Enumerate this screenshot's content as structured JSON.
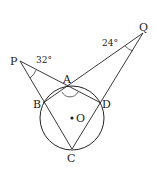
{
  "diagram": {
    "points": {
      "P": {
        "label": "P",
        "x": 20,
        "y": 61
      },
      "Q": {
        "label": "Q",
        "x": 143,
        "y": 33
      },
      "A": {
        "label": "A",
        "x": 70,
        "y": 86
      },
      "B": {
        "label": "B",
        "x": 43,
        "y": 103
      },
      "C": {
        "label": "C",
        "x": 72,
        "y": 149
      },
      "D": {
        "label": "D",
        "x": 101,
        "y": 103
      },
      "O": {
        "label": "O",
        "x": 72,
        "y": 118
      }
    },
    "circle": {
      "center": "O",
      "r": 32
    },
    "angles": {
      "P": {
        "label": "32°"
      },
      "Q": {
        "label": "24°"
      }
    },
    "colors": {
      "stroke": "#222222",
      "background": "#ffffff"
    }
  }
}
